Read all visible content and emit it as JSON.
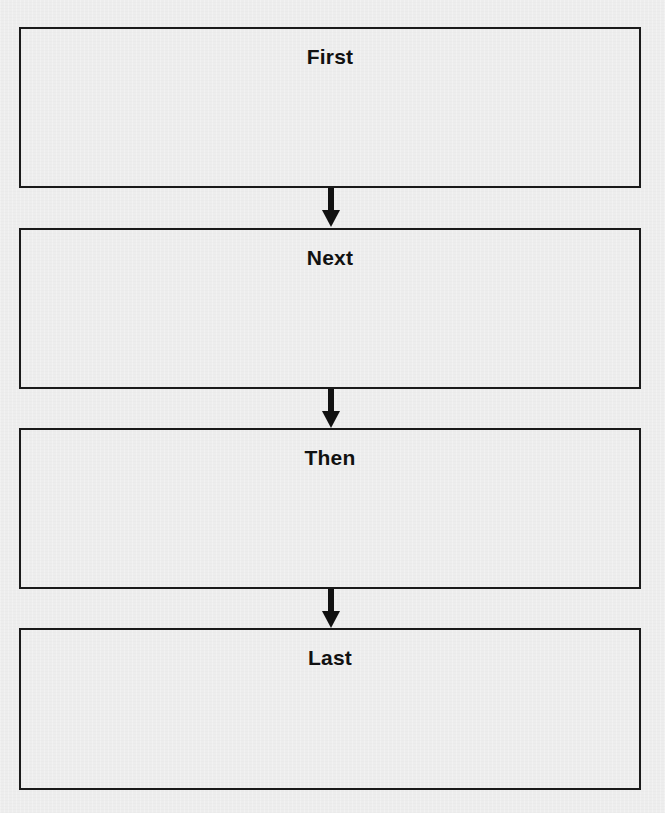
{
  "diagram": {
    "type": "sequence-flowchart",
    "direction": "top-to-bottom",
    "colors": {
      "background": "#ededed",
      "border": "#1a1a1a",
      "text": "#111111",
      "arrow": "#111111"
    },
    "steps": [
      {
        "label": "First"
      },
      {
        "label": "Next"
      },
      {
        "label": "Then"
      },
      {
        "label": "Last"
      }
    ],
    "connectors": [
      {
        "from": "First",
        "to": "Next",
        "icon": "down-arrow"
      },
      {
        "from": "Next",
        "to": "Then",
        "icon": "down-arrow"
      },
      {
        "from": "Then",
        "to": "Last",
        "icon": "down-arrow"
      }
    ]
  }
}
